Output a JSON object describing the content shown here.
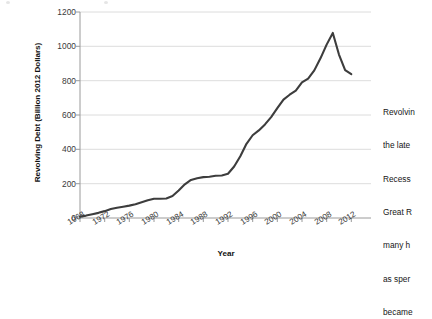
{
  "figure": {
    "background_color": "#ffffff",
    "line_color": "#3d3d3d",
    "gridline_color": "#d0d0d0",
    "axis_color": "#9a9a9a"
  },
  "chart_data": {
    "type": "line",
    "title": "",
    "xlabel": "Year",
    "ylabel": "Revolving Debt (Billion 2012 Dollars)",
    "xlim": [
      1968,
      2013
    ],
    "ylim": [
      0,
      1200
    ],
    "grid": true,
    "legend": "none",
    "y_ticks": [
      0,
      200,
      400,
      600,
      800,
      1000,
      1200
    ],
    "x_ticks": [
      1968,
      1972,
      1976,
      1980,
      1984,
      1988,
      1992,
      1996,
      2000,
      2004,
      2008,
      2012
    ],
    "series": [
      {
        "name": "Revolving Debt",
        "x": [
          1968,
          1969,
          1970,
          1971,
          1972,
          1973,
          1974,
          1975,
          1976,
          1977,
          1978,
          1979,
          1980,
          1981,
          1982,
          1983,
          1984,
          1985,
          1986,
          1987,
          1988,
          1989,
          1990,
          1991,
          1992,
          1993,
          1994,
          1995,
          1996,
          1997,
          1998,
          1999,
          2000,
          2001,
          2002,
          2003,
          2004,
          2005,
          2006,
          2007,
          2008,
          2009,
          2010,
          2011,
          2012
        ],
        "values": [
          8,
          14,
          22,
          30,
          40,
          52,
          60,
          66,
          72,
          80,
          92,
          104,
          112,
          112,
          114,
          128,
          160,
          196,
          222,
          232,
          238,
          240,
          246,
          248,
          258,
          300,
          360,
          432,
          482,
          510,
          545,
          588,
          640,
          690,
          718,
          742,
          790,
          812,
          860,
          930,
          1010,
          1078,
          952,
          862,
          838
        ]
      }
    ],
    "annotations": []
  },
  "body_text": {
    "lines": [
      "Revolvin",
      "the late",
      "Recess",
      "Great R",
      "many h",
      "as sper",
      "became"
    ]
  }
}
